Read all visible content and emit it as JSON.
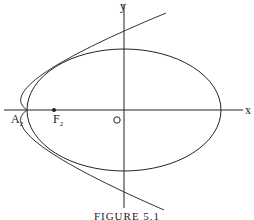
{
  "figure": {
    "caption": "FIGURE 5.1",
    "axes": {
      "x_label": "x",
      "y_label": "y",
      "origin_label": "O"
    },
    "points": [
      {
        "name": "A",
        "subscript": "2",
        "role": "vertex"
      },
      {
        "name": "F",
        "subscript": "2",
        "role": "focus"
      }
    ],
    "curves": [
      "ellipse",
      "parabola"
    ],
    "colors": {
      "stroke": "#222222",
      "background": "#ffffff"
    }
  }
}
